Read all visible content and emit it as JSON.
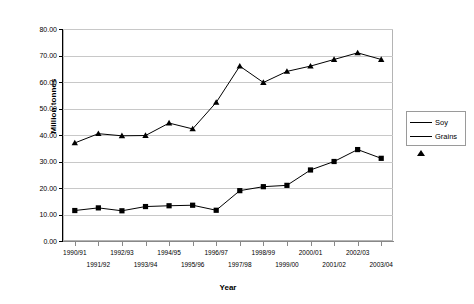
{
  "chart_data": {
    "type": "line",
    "title": "",
    "xlabel": "Year",
    "ylabel": "Million tonnes",
    "ylim": [
      0,
      80
    ],
    "ytick_step": 10,
    "ytick_labels": [
      "0.00",
      "10.00",
      "20.00",
      "30.00",
      "40.00",
      "50.00",
      "60.00",
      "70.00",
      "80.00"
    ],
    "ytick_values": [
      0,
      10,
      20,
      30,
      40,
      50,
      60,
      70,
      80
    ],
    "grid": true,
    "legend_position": "right",
    "categories": [
      "1990/91",
      "1991/92",
      "1992/93",
      "1993/94",
      "1994/95",
      "1995/96",
      "1996/97",
      "1997/98",
      "1998/99",
      "1999/00",
      "2000/01",
      "2001/02",
      "2002/03",
      "2003/04"
    ],
    "series": [
      {
        "name": "Soy",
        "marker": "square",
        "values": [
          11.5,
          12.5,
          11.4,
          13.0,
          13.3,
          13.5,
          11.6,
          19.0,
          20.5,
          21.0,
          26.8,
          30.0,
          34.5,
          31.2
        ]
      },
      {
        "name": "Grains",
        "marker": "triangle",
        "values": [
          37.0,
          40.5,
          39.7,
          39.8,
          44.5,
          42.3,
          52.3,
          66.0,
          59.8,
          64.0,
          66.0,
          68.5,
          71.0,
          68.5
        ]
      }
    ]
  },
  "legend": {
    "items": [
      {
        "label": "Soy"
      },
      {
        "label": "Grains"
      }
    ]
  },
  "axes": {
    "y_title": "Million tonnes",
    "x_title": "Year"
  }
}
